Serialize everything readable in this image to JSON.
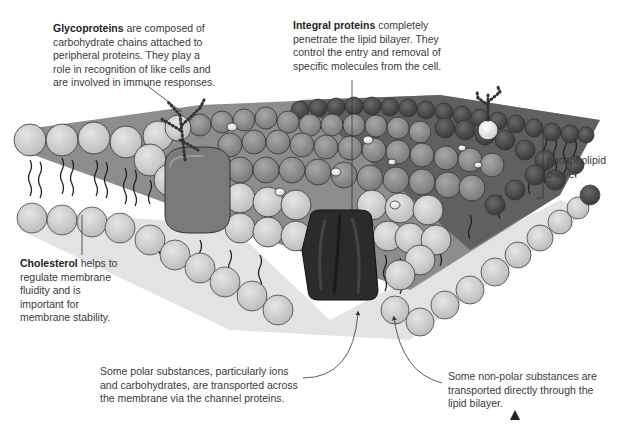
{
  "diagram": {
    "labels": {
      "glycoproteins": {
        "term": "Glycoproteins",
        "text": " are composed of carbohydrate chains attached to peripheral proteins. They play a role in recognition of like cells and are involved in immune responses."
      },
      "integral_proteins": {
        "term": "Integral proteins",
        "text": " completely penetrate the lipid bilayer. They control the entry and removal of specific molecules from the cell."
      },
      "cholesterol": {
        "term": "Cholesterol",
        "text": " helps to regulate membrane fluidity and is important for membrane stability."
      },
      "phospholipid_bilayer": "phospholipid bilayer",
      "polar_transport": "Some polar substances, particularly ions and carbohydrates, are transported across the membrane via the channel proteins.",
      "nonpolar_transport": "Some non-polar substances are transported directly through the lipid bilayer."
    },
    "colors": {
      "head_light": "#d9d9d9",
      "head_mid": "#9a9a9a",
      "head_dark": "#4a4a4a",
      "glycoprotein": "#7a7a7a",
      "channel_protein": "#2b2b2b",
      "tails": "#222222",
      "outline": "#333333"
    }
  }
}
